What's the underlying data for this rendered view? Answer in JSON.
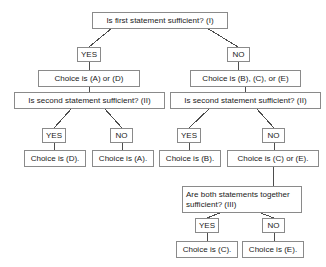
{
  "diagram": {
    "type": "flowchart",
    "style": {
      "box_border_color": "#8a8a8a",
      "box_fill_color": "#ffffff",
      "text_color": "#1a1a1a",
      "connector_color": "#4d4d4d"
    },
    "nodes": {
      "q1": "Is first statement sufficient? (I)",
      "q1_yes": "YES",
      "q1_no": "NO",
      "branch_left_choices": "Choice is (A) or (D)",
      "branch_right_choices": "Choice is (B), (C), or (E)",
      "q2_left": "Is second statement sufficient? (II)",
      "q2_right": "Is second statement sufficient? (II)",
      "q2_left_yes": "YES",
      "q2_left_no": "NO",
      "q2_right_yes": "YES",
      "q2_right_no": "NO",
      "result_d": "Choice is (D).",
      "result_a": "Choice is (A).",
      "result_b": "Choice is (B).",
      "result_ce": "Choice is (C) or (E).",
      "q3": "Are both statements together sufficient? (III)",
      "q3_yes": "YES",
      "q3_no": "NO",
      "result_c": "Choice is (C).",
      "result_e": "Choice is (E)."
    }
  }
}
